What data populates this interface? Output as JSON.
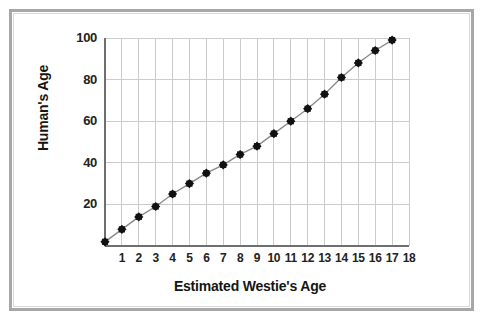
{
  "figure": {
    "background_color": "#ffffff",
    "frame_color": "#a7a7a7",
    "inner_frame_color": "#d8d8d8"
  },
  "chart_data": {
    "type": "line",
    "title": "",
    "xlabel": "Estimated Westie's Age",
    "ylabel": "Human's Age",
    "x": [
      0,
      1,
      2,
      3,
      4,
      5,
      6,
      7,
      8,
      9,
      10,
      11,
      12,
      13,
      14,
      15,
      16,
      17
    ],
    "values": [
      2,
      8,
      14,
      19,
      25,
      30,
      35,
      39,
      44,
      48,
      54,
      60,
      66,
      73,
      81,
      88,
      94,
      99
    ],
    "series": [
      {
        "name": "Westie to human age",
        "values": [
          2,
          8,
          14,
          19,
          25,
          30,
          35,
          39,
          44,
          48,
          54,
          60,
          66,
          73,
          81,
          88,
          94,
          99
        ]
      }
    ],
    "xlim": [
      0,
      18
    ],
    "ylim": [
      0,
      100
    ],
    "xticks": [
      1,
      2,
      3,
      4,
      5,
      6,
      7,
      8,
      9,
      10,
      11,
      12,
      13,
      14,
      15,
      16,
      17,
      18
    ],
    "yticks": [
      20,
      40,
      60,
      80,
      100
    ],
    "xtick_labels": [
      "1",
      "2",
      "3",
      "4",
      "5",
      "6",
      "7",
      "8",
      "9",
      "10",
      "11",
      "12",
      "13",
      "14",
      "15",
      "16",
      "17",
      "18"
    ],
    "ytick_labels": [
      "20",
      "40",
      "60",
      "80",
      "100"
    ],
    "grid": true,
    "grid_color": "#cccccc",
    "legend": false,
    "legend_position": "none",
    "marker": "diamond",
    "marker_color": "#111111",
    "line_color": "#8a8a8a",
    "axis_color": "#6f6f6f"
  }
}
